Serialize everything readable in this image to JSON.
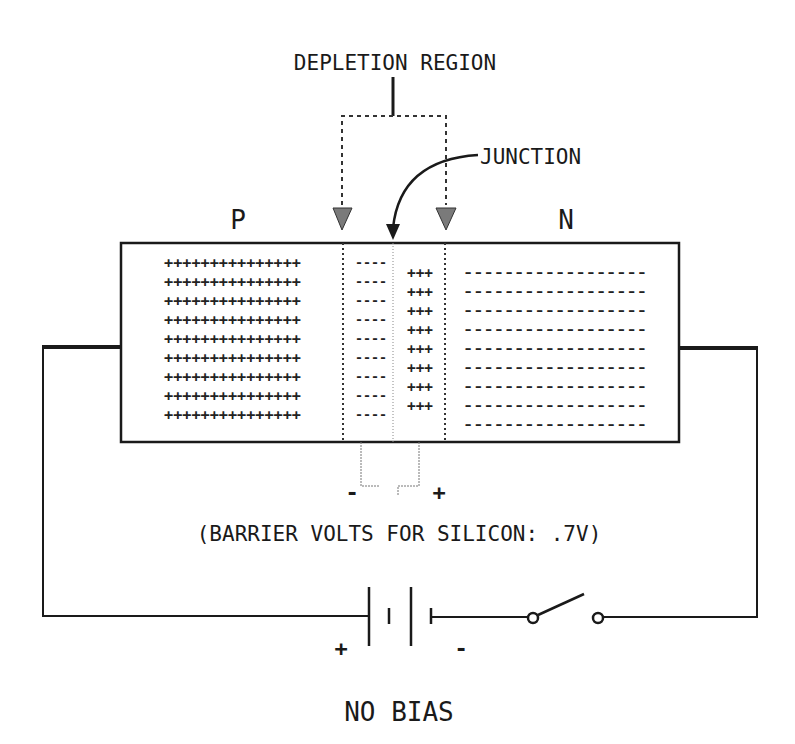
{
  "title": "NO BIAS",
  "labels": {
    "depletion_region": "DEPLETION REGION",
    "junction": "JUNCTION",
    "p_side": "P",
    "n_side": "N",
    "barrier_minus": "-",
    "barrier_plus": "+",
    "barrier_note": "(BARRIER VOLTS FOR SILICON: .7V)",
    "battery_plus": "+",
    "battery_minus": "-",
    "caption": "NO BIAS"
  },
  "regions": {
    "p_region": {
      "symbol": "+",
      "rows": 9,
      "per_row": 15,
      "row_text": "+++++++++++++++"
    },
    "depletion_p_side": {
      "symbol": "-",
      "rows": 9,
      "per_row": 4,
      "row_text": "----"
    },
    "depletion_n_side": {
      "symbol": "+",
      "rows": 8,
      "per_row": 3,
      "row_text": "+++"
    },
    "n_region": {
      "symbol": "-",
      "rows": 9,
      "per_row": 18,
      "row_text": "------------------"
    }
  },
  "circuit": {
    "battery": {
      "cells": 2,
      "polarity_left": "+",
      "polarity_right": "-"
    },
    "switch": {
      "state": "open"
    }
  },
  "colors": {
    "ink": "#1a1a1a",
    "arrow_fill": "#7a7a7a",
    "background": "#ffffff"
  }
}
